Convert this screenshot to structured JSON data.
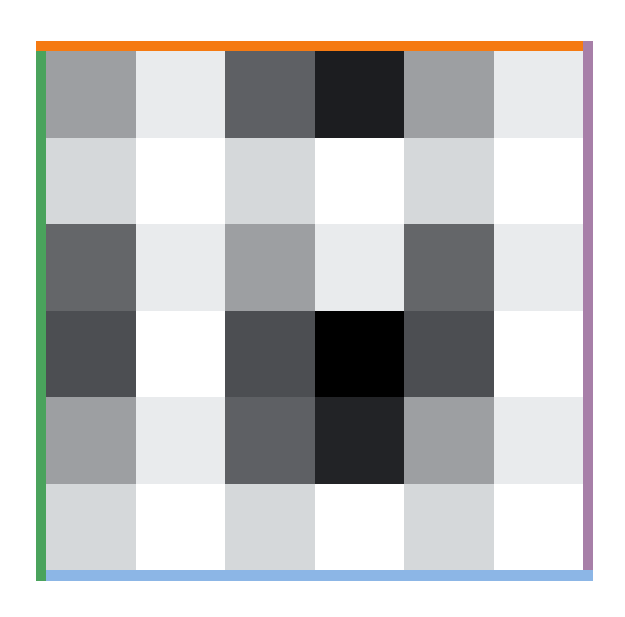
{
  "chart_data": {
    "type": "heatmap",
    "title": "",
    "xlabel": "",
    "ylabel": "",
    "rows": 6,
    "cols": 6,
    "colormap": "grayscale (0 = white, 1 = black)",
    "values": [
      [
        0.4,
        0.08,
        0.64,
        0.9,
        0.4,
        0.08
      ],
      [
        0.16,
        0.0,
        0.16,
        0.0,
        0.16,
        0.0
      ],
      [
        0.6,
        0.08,
        0.4,
        0.08,
        0.6,
        0.08
      ],
      [
        0.7,
        0.0,
        0.7,
        1.0,
        0.7,
        0.0
      ],
      [
        0.4,
        0.08,
        0.64,
        0.88,
        0.4,
        0.08
      ],
      [
        0.16,
        0.0,
        0.16,
        0.0,
        0.16,
        0.0
      ]
    ],
    "cell_colors": [
      [
        "#9d9fa2",
        "#e9ebed",
        "#5e6064",
        "#1c1d20",
        "#9d9fa2",
        "#e9ebed"
      ],
      [
        "#d5d8da",
        "#ffffff",
        "#d5d8da",
        "#ffffff",
        "#d5d8da",
        "#ffffff"
      ],
      [
        "#646669",
        "#e9ebed",
        "#9d9fa2",
        "#e9ebed",
        "#646669",
        "#e9ebed"
      ],
      [
        "#4c4e52",
        "#ffffff",
        "#4c4e52",
        "#000000",
        "#4c4e52",
        "#ffffff"
      ],
      [
        "#9d9fa2",
        "#e9ebed",
        "#5e6064",
        "#222326",
        "#9d9fa2",
        "#e9ebed"
      ],
      [
        "#d5d8da",
        "#ffffff",
        "#d5d8da",
        "#ffffff",
        "#d5d8da",
        "#ffffff"
      ]
    ],
    "grid": false,
    "legend": null
  },
  "border_colors": {
    "top": "#f57a12",
    "left": "#4aa35c",
    "right": "#a77fa8",
    "bottom": "#8cb6e6"
  }
}
